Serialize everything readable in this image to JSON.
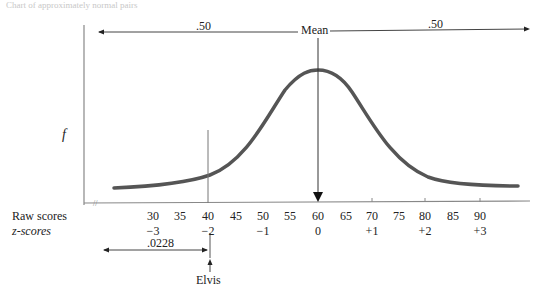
{
  "header_faint_text": "Chart of approximately normal pairs",
  "diagram": {
    "y_axis_label": "f",
    "mean_label": "Mean",
    "left_proportion": ".50",
    "right_proportion": ".50",
    "tail_proportion": ".0228",
    "marker_label": "Elvis",
    "row_labels": {
      "raw": "Raw scores",
      "z": "z-scores"
    },
    "raw_scores": [
      "30",
      "35",
      "40",
      "45",
      "50",
      "55",
      "60",
      "65",
      "70",
      "75",
      "80",
      "85",
      "90"
    ],
    "z_scores": [
      {
        "raw": "30",
        "z": "−3"
      },
      {
        "raw": "40",
        "z": "−2"
      },
      {
        "raw": "50",
        "z": "−1"
      },
      {
        "raw": "60",
        "z": "0"
      },
      {
        "raw": "70",
        "z": "+1"
      },
      {
        "raw": "80",
        "z": "+2"
      },
      {
        "raw": "90",
        "z": "+3"
      }
    ],
    "curve_color": "#555555",
    "mean_raw": 60,
    "sd": 10
  }
}
